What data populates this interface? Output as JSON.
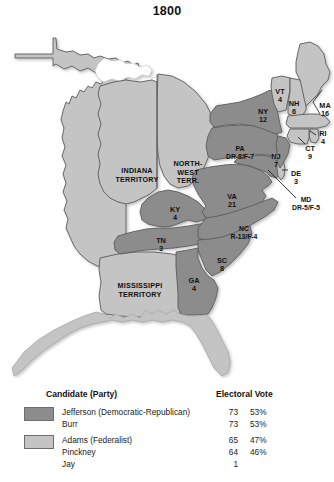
{
  "map": {
    "title": "1800",
    "colors": {
      "democratic_republican": "#8c8c8c",
      "federalist": "#c4c4c4",
      "territory": "#c4c4c4",
      "water": "#ffffff",
      "border": "#5a5a5a",
      "text": "#111111"
    },
    "states": [
      {
        "id": "ME-part-of-MA",
        "abbr": "",
        "votes": "",
        "party": "federalist",
        "label_x": 0,
        "label_y": 0,
        "show_label": false
      },
      {
        "id": "VT",
        "abbr": "VT",
        "votes": "4",
        "party": "federalist",
        "label_x": 280,
        "label_y": 76,
        "show_label": true
      },
      {
        "id": "NH",
        "abbr": "NH",
        "votes": "6",
        "party": "federalist",
        "label_x": 294,
        "label_y": 88,
        "show_label": true
      },
      {
        "id": "MA",
        "abbr": "MA",
        "votes": "16",
        "party": "federalist",
        "label_x": 325,
        "label_y": 90,
        "show_label": true,
        "callout": true
      },
      {
        "id": "NY",
        "abbr": "NY",
        "votes": "12",
        "party": "democratic_republican",
        "label_x": 263,
        "label_y": 96,
        "show_label": true
      },
      {
        "id": "RI",
        "abbr": "RI",
        "votes": "4",
        "party": "federalist",
        "label_x": 323,
        "label_y": 118,
        "show_label": true,
        "callout": true
      },
      {
        "id": "CT",
        "abbr": "CT",
        "votes": "9",
        "party": "federalist",
        "label_x": 310,
        "label_y": 133,
        "show_label": true,
        "callout": true
      },
      {
        "id": "PA",
        "abbr": "PA",
        "votes": "DR-8/F-7",
        "party": "democratic_republican",
        "label_x": 240,
        "label_y": 133,
        "show_label": true,
        "split": true
      },
      {
        "id": "NJ",
        "abbr": "NJ",
        "votes": "7",
        "party": "democratic_republican",
        "label_x": 276,
        "label_y": 141,
        "show_label": true
      },
      {
        "id": "DE",
        "abbr": "DE",
        "votes": "3",
        "party": "federalist",
        "label_x": 296,
        "label_y": 158,
        "show_label": true,
        "callout": true
      },
      {
        "id": "MD",
        "abbr": "MD",
        "votes": "DR-5/F-5",
        "party": "democratic_republican",
        "label_x": 306,
        "label_y": 184,
        "show_label": true,
        "split": true,
        "callout": true
      },
      {
        "id": "VA",
        "abbr": "VA",
        "votes": "21",
        "party": "democratic_republican",
        "label_x": 232,
        "label_y": 181,
        "show_label": true
      },
      {
        "id": "KY",
        "abbr": "KY",
        "votes": "4",
        "party": "democratic_republican",
        "label_x": 175,
        "label_y": 194,
        "show_label": true
      },
      {
        "id": "NC",
        "abbr": "NC",
        "votes": "R-13/F-4",
        "party": "democratic_republican",
        "label_x": 244,
        "label_y": 213,
        "show_label": true,
        "split": true
      },
      {
        "id": "TN",
        "abbr": "TN",
        "votes": "3",
        "party": "democratic_republican",
        "label_x": 161,
        "label_y": 225,
        "show_label": true
      },
      {
        "id": "SC",
        "abbr": "SC",
        "votes": "8",
        "party": "democratic_republican",
        "label_x": 222,
        "label_y": 245,
        "show_label": true
      },
      {
        "id": "GA",
        "abbr": "GA",
        "votes": "4",
        "party": "democratic_republican",
        "label_x": 194,
        "label_y": 265,
        "show_label": true
      }
    ],
    "territories": [
      {
        "id": "INDIANA-TERRITORY",
        "lines": [
          "INDIANA",
          "TERRITORY"
        ],
        "label_x": 137,
        "label_y": 155
      },
      {
        "id": "NORTHWEST-TERRITORY",
        "lines": [
          "NORTH-",
          "WEST",
          "TERR."
        ],
        "label_x": 188,
        "label_y": 148
      },
      {
        "id": "MISSISSIPPI-TERRITORY",
        "lines": [
          "MISSISSIPPI",
          "TERRITORY"
        ],
        "label_x": 140,
        "label_y": 270
      }
    ]
  },
  "legend": {
    "header_candidate": "Candidate (Party)",
    "header_electoral": "Electoral Vote",
    "rows": [
      {
        "name": "Jefferson (Democratic-Republican)",
        "votes": "73",
        "percent": "53%",
        "swatch": "democratic_republican"
      },
      {
        "name": "Burr",
        "votes": "73",
        "percent": "53%",
        "swatch": null
      },
      {
        "name": "Adams (Federalist)",
        "votes": "65",
        "percent": "47%",
        "swatch": "federalist"
      },
      {
        "name": "Pinckney",
        "votes": "64",
        "percent": "46%",
        "swatch": null
      },
      {
        "name": "Jay",
        "votes": "1",
        "percent": "",
        "swatch": null
      }
    ]
  }
}
